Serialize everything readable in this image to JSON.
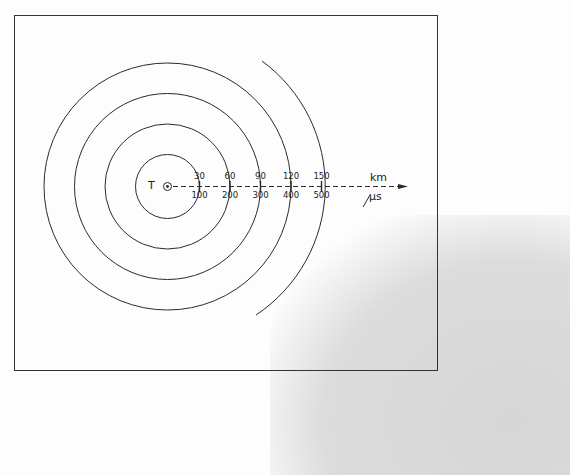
{
  "diagram": {
    "origin_label": "T",
    "axis_top_unit": "km",
    "axis_bottom_unit": "µs",
    "ticks": [
      {
        "top": "30",
        "bottom": "100"
      },
      {
        "top": "60",
        "bottom": "200"
      },
      {
        "top": "90",
        "bottom": "300"
      },
      {
        "top": "120",
        "bottom": "400"
      },
      {
        "top": "150",
        "bottom": "500"
      }
    ],
    "rings": 4,
    "partial_arcs": 1,
    "colors": {
      "line": "#2a2a2a",
      "background": "#fdfdfd",
      "shadow": "#d9d9d9"
    }
  }
}
